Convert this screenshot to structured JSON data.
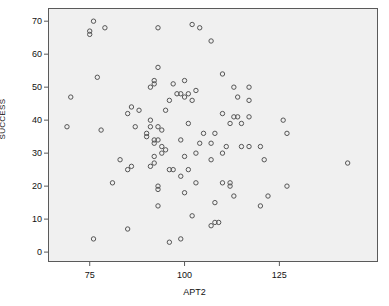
{
  "chart_data": {
    "type": "scatter",
    "title": "",
    "xlabel": "APT2",
    "ylabel": "SUCCESS",
    "xlim": [
      64,
      151
    ],
    "ylim": [
      -3,
      74
    ],
    "xticks": [
      75,
      100,
      125
    ],
    "xtick_labels": [
      "75",
      "100",
      "125"
    ],
    "yticks": [
      0,
      10,
      20,
      30,
      40,
      50,
      60,
      70
    ],
    "ytick_labels": [
      "0",
      "10",
      "20",
      "30",
      "40",
      "50",
      "60",
      "70"
    ],
    "grid": false,
    "legend": null,
    "marker": "open-circle",
    "marker_color": "#555555",
    "plot_background": "#f0f0f0",
    "points": [
      [
        76,
        70
      ],
      [
        75,
        67
      ],
      [
        75,
        66
      ],
      [
        79,
        68
      ],
      [
        93,
        68
      ],
      [
        102,
        69
      ],
      [
        104,
        68
      ],
      [
        107,
        64
      ],
      [
        77,
        53
      ],
      [
        93,
        56
      ],
      [
        110,
        54
      ],
      [
        92,
        52
      ],
      [
        92,
        51
      ],
      [
        97,
        51
      ],
      [
        91,
        50
      ],
      [
        100,
        52
      ],
      [
        113,
        50
      ],
      [
        117,
        50
      ],
      [
        98,
        48
      ],
      [
        101,
        48
      ],
      [
        100,
        47
      ],
      [
        99,
        48
      ],
      [
        103,
        49
      ],
      [
        114,
        47
      ],
      [
        96,
        46
      ],
      [
        102,
        46
      ],
      [
        117,
        46
      ],
      [
        70,
        47
      ],
      [
        86,
        44
      ],
      [
        85,
        42
      ],
      [
        88,
        43
      ],
      [
        95,
        43
      ],
      [
        110,
        42
      ],
      [
        114,
        41
      ],
      [
        113,
        41
      ],
      [
        117,
        41
      ],
      [
        126,
        40
      ],
      [
        69,
        38
      ],
      [
        87,
        38
      ],
      [
        91,
        38
      ],
      [
        93,
        38
      ],
      [
        91,
        40
      ],
      [
        101,
        39
      ],
      [
        112,
        39
      ],
      [
        115,
        39
      ],
      [
        78,
        37
      ],
      [
        94,
        37
      ],
      [
        90,
        36
      ],
      [
        105,
        36
      ],
      [
        108,
        36
      ],
      [
        127,
        36
      ],
      [
        90,
        35
      ],
      [
        92,
        34
      ],
      [
        92,
        33
      ],
      [
        99,
        34
      ],
      [
        93,
        34
      ],
      [
        104,
        33
      ],
      [
        107,
        33
      ],
      [
        94,
        32
      ],
      [
        111,
        32
      ],
      [
        115,
        32
      ],
      [
        117,
        32
      ],
      [
        120,
        32
      ],
      [
        95,
        31
      ],
      [
        94,
        30
      ],
      [
        103,
        30
      ],
      [
        110,
        30
      ],
      [
        92,
        29
      ],
      [
        100,
        29
      ],
      [
        83,
        28
      ],
      [
        107,
        28
      ],
      [
        121,
        28
      ],
      [
        92,
        27
      ],
      [
        91,
        26
      ],
      [
        85,
        25
      ],
      [
        86,
        26
      ],
      [
        96,
        25
      ],
      [
        97,
        25
      ],
      [
        101,
        25
      ],
      [
        143,
        27
      ],
      [
        99,
        23
      ],
      [
        81,
        21
      ],
      [
        103,
        21
      ],
      [
        110,
        21
      ],
      [
        112,
        21
      ],
      [
        112,
        20
      ],
      [
        93,
        20
      ],
      [
        93,
        19
      ],
      [
        127,
        20
      ],
      [
        113,
        17
      ],
      [
        122,
        17
      ],
      [
        100,
        18
      ],
      [
        93,
        14
      ],
      [
        120,
        14
      ],
      [
        108,
        15
      ],
      [
        102,
        11
      ],
      [
        108,
        9
      ],
      [
        109,
        9
      ],
      [
        107,
        8
      ],
      [
        85,
        7
      ],
      [
        76,
        4
      ],
      [
        96,
        3
      ],
      [
        99,
        4
      ]
    ]
  }
}
